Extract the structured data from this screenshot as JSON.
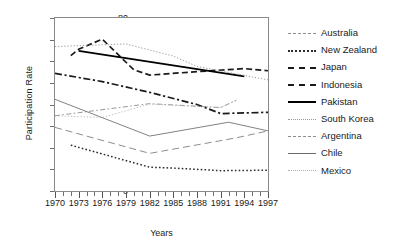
{
  "chart_data": {
    "type": "line",
    "title": "",
    "xlabel": "Years",
    "ylabel": "Participation Rate",
    "xlim": [
      1970,
      1997
    ],
    "ylim": [
      0,
      80
    ],
    "ytick_step": 10,
    "yticks": [
      0,
      10,
      20,
      30,
      40,
      50,
      60,
      70,
      80
    ],
    "xticks": [
      1970,
      1971,
      1972,
      1973,
      1974,
      1975,
      1976,
      1977,
      1978,
      1979,
      1980,
      1981,
      1982,
      1983,
      1984,
      1985,
      1986,
      1987,
      1988,
      1989,
      1990,
      1991,
      1992,
      1993,
      1994,
      1995,
      1996,
      1997
    ],
    "xtick_labels": [
      "1970",
      "1973",
      "1976",
      "1979",
      "1982",
      "1985",
      "1988",
      "1991",
      "1994",
      "1997"
    ],
    "xtick_label_years": [
      1970,
      1973,
      1976,
      1979,
      1982,
      1985,
      1988,
      1991,
      1994,
      1997
    ],
    "grid": false,
    "legend_position": "right",
    "series": [
      {
        "name": "Australia",
        "style": "dash-dot-thin",
        "color": "#8d8d8d",
        "x": [
          1970,
          1982,
          1991,
          1993
        ],
        "values": [
          34.8,
          40.4,
          38.6,
          42.0
        ]
      },
      {
        "name": "New Zealand",
        "style": "dotted-round",
        "color": "#2b2b2b",
        "x": [
          1972,
          1982,
          1985,
          1991,
          1997
        ],
        "values": [
          21.2,
          11.0,
          10.6,
          9.4,
          9.6
        ]
      },
      {
        "name": "Japan",
        "style": "dash-dot",
        "color": "#1a1a1a",
        "x": [
          1970,
          1976,
          1982,
          1988,
          1991,
          1997
        ],
        "values": [
          54.4,
          50.6,
          45.6,
          40.0,
          35.8,
          36.4
        ]
      },
      {
        "name": "Indonesia",
        "style": "dashed",
        "color": "#1a1a1a",
        "x": [
          1972,
          1973,
          1976,
          1980,
          1982,
          1988,
          1994,
          1997
        ],
        "values": [
          62.6,
          65.6,
          70.2,
          56.0,
          53.6,
          55.2,
          56.6,
          55.6
        ]
      },
      {
        "name": "Pakistan",
        "style": "solid-bold",
        "color": "#000000",
        "x": [
          1973,
          1994
        ],
        "values": [
          64.8,
          53.0
        ]
      },
      {
        "name": "South Korea",
        "style": "dotted-fine",
        "color": "#9a9a9a",
        "x": [
          1970,
          1979,
          1985,
          1988,
          1997
        ],
        "values": [
          66.8,
          68.0,
          62.4,
          57.6,
          51.4
        ]
      },
      {
        "name": "Argentina",
        "style": "dashed-long",
        "color": "#8d8d8d",
        "x": [
          1970,
          1982,
          1993,
          1997
        ],
        "values": [
          29.4,
          17.4,
          24.6,
          27.8
        ]
      },
      {
        "name": "Chile",
        "style": "solid-thin",
        "color": "#6b6b6b",
        "x": [
          1970,
          1982,
          1992,
          1997
        ],
        "values": [
          42.4,
          25.4,
          31.8,
          27.8
        ]
      },
      {
        "name": "Mexico",
        "style": "dotted-pale",
        "color": "#b0b0b0",
        "x": [
          1970,
          1976,
          1982,
          1991,
          1993
        ],
        "values": [
          34.8,
          34.0,
          40.2,
          38.6,
          42.0
        ]
      }
    ]
  },
  "axes": {
    "ylabel": "Participation Rate",
    "xlabel": "Years",
    "ytick_labels": [
      "80",
      "70",
      "60",
      "50",
      "40",
      "30",
      "20",
      "10",
      "0"
    ]
  },
  "legend": {
    "items": [
      {
        "label": "Australia"
      },
      {
        "label": "New Zealand"
      },
      {
        "label": "Japan"
      },
      {
        "label": "Indonesia"
      },
      {
        "label": "Pakistan"
      },
      {
        "label": "South Korea"
      },
      {
        "label": "Argentina"
      },
      {
        "label": "Chile"
      },
      {
        "label": "Mexico"
      }
    ]
  }
}
